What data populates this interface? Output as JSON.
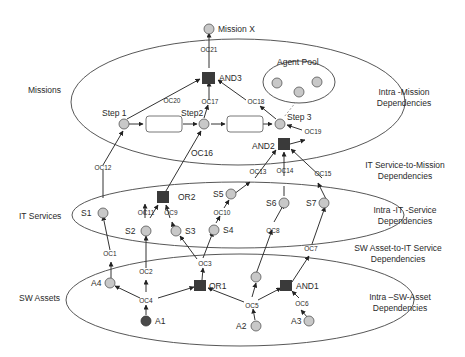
{
  "colors": {
    "background": "#ffffff",
    "line": "#333333",
    "node_fill": "#c8c8c8",
    "node_stroke": "#555555",
    "gate_fill": "#3a3a3a",
    "source_fill": "#4a4a4a",
    "agent_link": "#999999"
  },
  "layers": {
    "missions": "Missions",
    "it_services": "IT Services",
    "sw_assets": "SW Assets"
  },
  "dependency_labels": {
    "intra_mission": [
      "Intra -Mission",
      "Dependencies"
    ],
    "it_to_mission": [
      "IT Service-to-Mission",
      "Dependencies"
    ],
    "intra_it": [
      "Intra -IT -Service",
      "Dependencies"
    ],
    "sw_to_it": [
      "SW Asset-to-IT Service",
      "Dependencies"
    ],
    "intra_sw": [
      "Intra –SW-Asset",
      "Dependencies"
    ]
  },
  "nodes": {
    "mission_x": "Mission X",
    "agent_pool": "Agent Pool",
    "step1": "Step 1",
    "step2": "Step2",
    "step3": "Step 3",
    "and3": "AND3",
    "and2": "AND2",
    "or2": "OR2",
    "or1": "OR1",
    "and1": "AND1",
    "s1": "S1",
    "s2": "S2",
    "s3": "S3",
    "s4": "S4",
    "s5": "S5",
    "s6": "S6",
    "s7": "S7",
    "a1": "A1",
    "a2": "A2",
    "a3": "A3",
    "a4": "A4"
  },
  "oc": {
    "oc1": "OC1",
    "oc2": "OC2",
    "oc3": "OC3",
    "oc4": "OC4",
    "oc5": "OC5",
    "oc6": "OC6",
    "oc7": "OC7",
    "oc8": "OC8",
    "oc9": "OC9",
    "oc10": "OC10",
    "oc11": "OC11",
    "oc12": "OC12",
    "oc13": "OC13",
    "oc14": "OC14",
    "oc15": "OC15",
    "oc16": "OC16",
    "oc17": "OC17",
    "oc18": "OC18",
    "oc19": "OC19",
    "oc20": "OC20",
    "oc21": "OC21"
  }
}
